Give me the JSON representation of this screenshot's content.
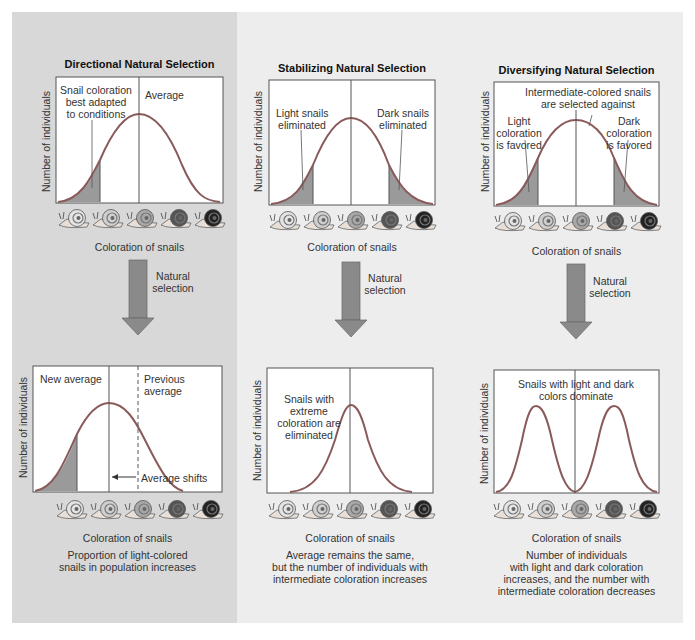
{
  "colors": {
    "left_panel_bg": "#d8d8d8",
    "right_panel_bg": "#ededed",
    "curve": "#8a5a5a",
    "fill": "#9a9a9a",
    "arrow": "#8a8a8a",
    "chart_bg": "#ffffff"
  },
  "common": {
    "y_axis_label": "Number of individuals",
    "x_axis_label": "Coloration of snails",
    "arrow_label_line1": "Natural",
    "arrow_label_line2": "selection",
    "snail_icons": [
      "snail-lightest",
      "snail-light",
      "snail-medium",
      "snail-dark",
      "snail-darkest"
    ]
  },
  "directional": {
    "title": "Directional Natural Selection",
    "top_annotation_line1": "Snail coloration",
    "top_annotation_line2": "best adapted",
    "top_annotation_line3": "to conditions",
    "top_average_label": "Average",
    "bottom_new_average": "New average",
    "bottom_previous_line1": "Previous",
    "bottom_previous_line2": "average",
    "bottom_shift_label": "Average shifts",
    "caption_line1": "Proportion of light-colored",
    "caption_line2": "snails in population increases"
  },
  "stabilizing": {
    "title": "Stabilizing Natural Selection",
    "light_line1": "Light snails",
    "light_line2": "eliminated",
    "dark_line1": "Dark snails",
    "dark_line2": "eliminated",
    "bottom_line1": "Snails with",
    "bottom_line2": "extreme",
    "bottom_line3": "coloration are",
    "bottom_line4": "eliminated",
    "caption_line1": "Average remains the same,",
    "caption_line2": "but the number of individuals with",
    "caption_line3": "intermediate coloration increases"
  },
  "diversifying": {
    "title": "Diversifying Natural Selection",
    "middle_line1": "Intermediate-colored snails",
    "middle_line2": "are selected against",
    "light_line1": "Light",
    "light_line2": "coloration",
    "light_line3": "is favored",
    "dark_line1": "Dark",
    "dark_line2": "coloration",
    "dark_line3": "is favored",
    "bottom_line1": "Snails with light and dark",
    "bottom_line2": "colors dominate",
    "caption_line1": "Number of individuals",
    "caption_line2": "with light and dark coloration",
    "caption_line3": "increases, and the number with",
    "caption_line4": "intermediate coloration decreases"
  }
}
